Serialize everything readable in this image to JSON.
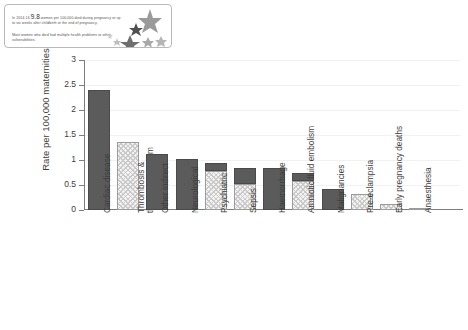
{
  "callout": {
    "line1_pre": "In 2014-16 ",
    "line1_num": "9.8",
    "line1_post": " women per 100,000 died during pregnancy or up to six weeks after childbirth or the end of pregnancy.",
    "line2": "Most women who died had multiple health problems or other vulnerabilities.",
    "decoration": "stars-cluster"
  },
  "chart_data": {
    "type": "bar",
    "stacked": true,
    "title": "",
    "xlabel": "",
    "ylabel": "Rate per 100,000 maternities",
    "ylim": [
      0,
      3
    ],
    "yticks": [
      "0",
      "0.5",
      "1",
      "1.5",
      "2",
      "2.5",
      "3"
    ],
    "grid": true,
    "legend_position": "none",
    "categories": [
      "Cardiac disease",
      "Thrombosis & thromboembolism",
      "Other indirect",
      "Neurological",
      "Psychiatric",
      "Sepsis",
      "Haemorrhage",
      "Amniotic fluid embolism",
      "Malignancies",
      "Pre-eclampsia",
      "Early pregnancy deaths",
      "Anaesthesia"
    ],
    "series": [
      {
        "name": "Indirect",
        "fill": "hatched",
        "color": "#f2f2f2",
        "values": [
          0,
          1.37,
          0,
          0,
          0.78,
          0.52,
          0,
          0.58,
          0,
          0.33,
          0.13,
          0.04
        ]
      },
      {
        "name": "Direct",
        "fill": "solid",
        "color": "#5b5b5b",
        "values": [
          2.4,
          0,
          1.12,
          1.03,
          0.17,
          0.33,
          0.85,
          0.17,
          0.43,
          0,
          0,
          0
        ]
      }
    ],
    "totals": [
      2.4,
      1.37,
      1.12,
      1.03,
      0.95,
      0.85,
      0.85,
      0.75,
      0.43,
      0.33,
      0.13,
      0.04
    ]
  }
}
